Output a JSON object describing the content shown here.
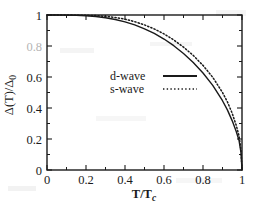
{
  "chart_data": {
    "type": "line",
    "title": "",
    "xlabel": "T/T_c",
    "ylabel": "Δ(T)/Δ0",
    "xlabel_parts": {
      "num": "T/T",
      "sub": "c"
    },
    "ylabel_parts": {
      "main": "Δ(T)/Δ",
      "sub": "0"
    },
    "xlim": [
      0,
      1
    ],
    "ylim": [
      0,
      1
    ],
    "grid": false,
    "legend_position": "center",
    "xticks": [
      "0",
      "0.2",
      "0.4",
      "0.6",
      "0.8",
      "1"
    ],
    "xtick_values": [
      0,
      0.2,
      0.4,
      0.6,
      0.8,
      1
    ],
    "yticks": [
      "0",
      "0.2",
      "0.4",
      "0.6",
      "0.8",
      "1"
    ],
    "ytick_values": [
      0,
      0.2,
      0.4,
      0.6,
      0.8,
      1
    ],
    "minor_ticks_per_interval": 1,
    "x": [
      0,
      0.05,
      0.1,
      0.15,
      0.2,
      0.25,
      0.3,
      0.35,
      0.4,
      0.45,
      0.5,
      0.55,
      0.6,
      0.65,
      0.7,
      0.75,
      0.8,
      0.85,
      0.9,
      0.925,
      0.95,
      0.97,
      0.985,
      0.995,
      1
    ],
    "series": [
      {
        "name": "d-wave",
        "style": "solid",
        "color": "#1a1a1a",
        "values": [
          1,
          1,
          0.999,
          0.998,
          0.995,
          0.99,
          0.982,
          0.971,
          0.956,
          0.936,
          0.911,
          0.881,
          0.845,
          0.802,
          0.752,
          0.694,
          0.626,
          0.546,
          0.447,
          0.388,
          0.317,
          0.25,
          0.19,
          0.11,
          0
        ]
      },
      {
        "name": "s-wave",
        "style": "dotted",
        "color": "#1a1a1a",
        "values": [
          1,
          1,
          1,
          0.999,
          0.998,
          0.996,
          0.991,
          0.984,
          0.973,
          0.957,
          0.936,
          0.91,
          0.878,
          0.839,
          0.793,
          0.739,
          0.675,
          0.598,
          0.5,
          0.44,
          0.365,
          0.29,
          0.22,
          0.125,
          0
        ]
      }
    ],
    "legend": [
      {
        "label": "d-wave",
        "style": "solid"
      },
      {
        "label": "s-wave",
        "style": "dotted"
      }
    ]
  },
  "figure": {
    "axis_color": "#1a1a1a",
    "background": "#ffffff"
  }
}
